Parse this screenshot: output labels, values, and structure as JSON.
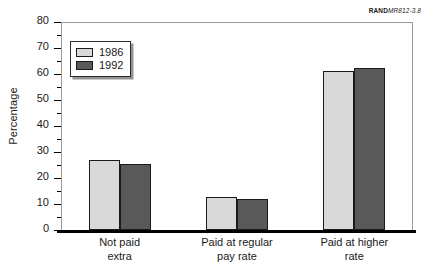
{
  "source_tag": {
    "brand": "RAND",
    "document_id": "MR812-3.8"
  },
  "chart_data": {
    "type": "bar",
    "title": "",
    "xlabel": "",
    "ylabel": "Percentage",
    "ylim": [
      0,
      80
    ],
    "y_major_step": 10,
    "y_minor_step": 5,
    "grid": false,
    "legend_position": "upper-left-inside",
    "categories": [
      "Not paid\nextra",
      "Paid at regular\npay rate",
      "Paid at higher\nrate"
    ],
    "category_lines": [
      [
        "Not paid",
        "extra"
      ],
      [
        "Paid at regular",
        "pay rate"
      ],
      [
        "Paid at higher",
        "rate"
      ]
    ],
    "series": [
      {
        "name": "1986",
        "color": "#d9d9d9",
        "values": [
          27,
          12.7,
          61
        ]
      },
      {
        "name": "1992",
        "color": "#595959",
        "values": [
          25.5,
          12.1,
          62.5
        ]
      }
    ],
    "y_tick_labels": [
      "0",
      "10",
      "20",
      "30",
      "40",
      "50",
      "60",
      "70",
      "80"
    ],
    "y_tick_values": [
      0,
      10,
      20,
      30,
      40,
      50,
      60,
      70,
      80
    ]
  }
}
